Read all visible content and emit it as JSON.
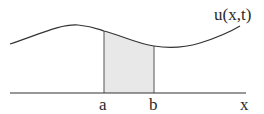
{
  "diagram": {
    "curve_label": "u(x,t)",
    "axis_label": "x",
    "lower_bound_label": "a",
    "upper_bound_label": "b",
    "colors": {
      "stroke": "#333333",
      "fill": "#e8e8e8",
      "background": "#ffffff"
    }
  }
}
